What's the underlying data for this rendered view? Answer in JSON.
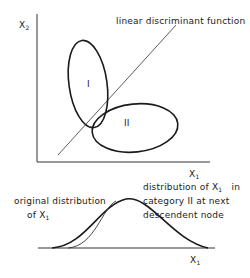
{
  "top_plot": {
    "y_axis_label": "X",
    "y_axis_sub": "2",
    "x_axis_label": "X",
    "x_axis_sub": "1",
    "line_label": "linear discriminant function",
    "category_I_label": "I",
    "category_II_label": "II"
  },
  "bottom_plot": {
    "left_label_line1": "original distribution",
    "left_label_line2": "of X",
    "left_label_sub": "1",
    "right_label_line1": "distribution of X",
    "right_label_sub": "1",
    "right_label_line1_tail": "in",
    "right_label_line2": "category II at next",
    "right_label_line3": "descendent node",
    "x_axis_label": "X",
    "x_axis_sub": "1"
  },
  "colors": {
    "stroke": "#1a1a1a",
    "text": "#222222",
    "background": "#ffffff"
  }
}
